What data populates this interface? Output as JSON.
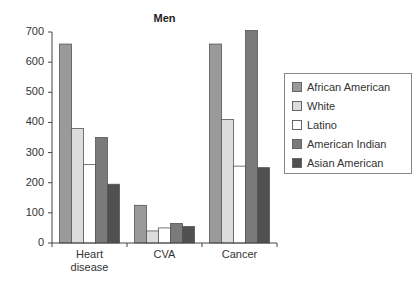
{
  "chart_data": {
    "type": "bar",
    "title": "Men",
    "xlabel": "",
    "ylabel": "",
    "ylim": [
      0,
      700
    ],
    "yticks": [
      0,
      100,
      200,
      300,
      400,
      500,
      600,
      700
    ],
    "grid": false,
    "legend_position": "right",
    "categories": [
      "Heart disease",
      "CVA",
      "Cancer"
    ],
    "series": [
      {
        "name": "African American",
        "color": "#9a9a9a",
        "values": [
          660,
          125,
          660
        ]
      },
      {
        "name": "White",
        "color": "#dcdcdc",
        "values": [
          380,
          40,
          410
        ]
      },
      {
        "name": "Latino",
        "color": "#ffffff",
        "values": [
          260,
          50,
          255
        ]
      },
      {
        "name": "American Indian",
        "color": "#7a7a7a",
        "values": [
          350,
          65,
          705
        ]
      },
      {
        "name": "Asian American",
        "color": "#505050",
        "values": [
          195,
          55,
          250
        ]
      }
    ]
  },
  "xlabels": [
    {
      "line1": "Heart",
      "line2": "disease"
    },
    {
      "line1": "CVA",
      "line2": ""
    },
    {
      "line1": "Cancer",
      "line2": ""
    }
  ]
}
